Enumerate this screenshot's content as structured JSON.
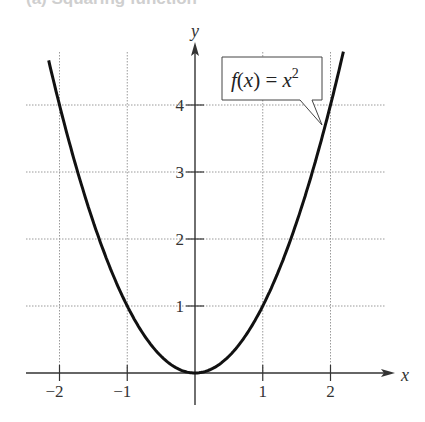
{
  "caption": "(a) Squaring function",
  "chart_data": {
    "type": "line",
    "title": "",
    "function": "f(x) = x^2",
    "xlabel": "x",
    "ylabel": "y",
    "xlim": [
      -2.5,
      2.9
    ],
    "ylim": [
      0,
      4.7
    ],
    "grid": true,
    "x_ticks": [
      -2,
      -1,
      1,
      2
    ],
    "x_tick_labels": [
      "−2",
      "−1",
      "1",
      "2"
    ],
    "y_ticks": [
      1,
      2,
      3,
      4
    ],
    "y_tick_labels": [
      "1",
      "2",
      "3",
      "4"
    ],
    "series": [
      {
        "name": "f(x) = x²",
        "x": [
          -2.2,
          -2,
          -1.5,
          -1,
          -0.5,
          0,
          0.5,
          1,
          1.5,
          2,
          2.2
        ],
        "y": [
          4.84,
          4,
          2.25,
          1,
          0.25,
          0,
          0.25,
          1,
          2.25,
          4,
          4.84
        ]
      }
    ],
    "annotations": [
      {
        "text": "f(x) = x²",
        "type": "callout",
        "points_to": [
          1.9,
          3.6
        ]
      }
    ]
  },
  "callout": {
    "fx": "f",
    "paren_open": "(",
    "var": "x",
    "paren_close": ")",
    "eq": " = ",
    "base": "x",
    "exp": "2"
  },
  "colors": {
    "curve": "#111111",
    "axis": "#333333",
    "grid": "#9a9a9a",
    "text": "#333333"
  }
}
